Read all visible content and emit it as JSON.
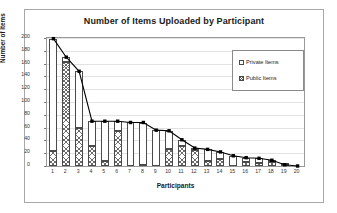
{
  "figure": {
    "background_color": "#ffffff",
    "frame_color": "#a8a8a8"
  },
  "chart_data": {
    "type": "bar",
    "title": "Number of Items Uploaded by Participant",
    "xlabel": "Participants",
    "ylabel": "Number of Items",
    "ylim": [
      0,
      200
    ],
    "yticks": [
      0,
      20,
      40,
      60,
      80,
      100,
      120,
      140,
      160,
      180,
      200
    ],
    "grid": true,
    "legend_position": "upper right",
    "stacked": true,
    "categories": [
      "1",
      "2",
      "3",
      "4",
      "5",
      "6",
      "7",
      "8",
      "9",
      "10",
      "11",
      "12",
      "13",
      "14",
      "15",
      "16",
      "17",
      "18",
      "19",
      "20"
    ],
    "series": [
      {
        "name": "Public Items",
        "fill": "hatched",
        "values": [
          24,
          162,
          60,
          32,
          8,
          55,
          0,
          2,
          0,
          26,
          31,
          25,
          8,
          11,
          0,
          6,
          5,
          6,
          1,
          0
        ]
      },
      {
        "name": "Private Items",
        "fill": "white",
        "values": [
          175,
          8,
          88,
          38,
          62,
          15,
          68,
          66,
          56,
          29,
          10,
          3,
          18,
          11,
          16,
          7,
          7,
          3,
          1,
          0
        ]
      }
    ],
    "total_line": {
      "name": "Total items",
      "marker": "square",
      "color": "#000000",
      "values": [
        199,
        170,
        148,
        70,
        70,
        70,
        68,
        68,
        56,
        55,
        41,
        28,
        26,
        22,
        16,
        13,
        12,
        9,
        2,
        0
      ]
    }
  },
  "legend": {
    "items": [
      {
        "label": "Private Items",
        "swatch": "private-swatch-icon"
      },
      {
        "label": "Public Items",
        "swatch": "public-swatch-icon"
      }
    ]
  }
}
